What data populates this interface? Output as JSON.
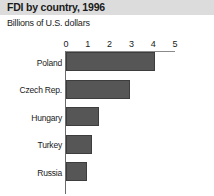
{
  "chart_data": {
    "type": "bar",
    "orientation": "horizontal",
    "title": "FDI by country, 1996",
    "subtitle": "Billions of U.S. dollars",
    "xlabel": "",
    "ylabel": "",
    "xlim": [
      0,
      5
    ],
    "xticks": [
      "0",
      "1",
      "2",
      "3",
      "4",
      "5"
    ],
    "grid": false,
    "legend": null,
    "categories": [
      "Poland",
      "Czech Rep.",
      "Hungary",
      "Turkey",
      "Russia"
    ],
    "values": [
      4.1,
      2.95,
      1.5,
      1.2,
      0.95
    ],
    "bars": [
      {
        "label": "Poland",
        "value": 4.1
      },
      {
        "label": "Czech Rep.",
        "value": 2.95
      },
      {
        "label": "Hungary",
        "value": 1.5
      },
      {
        "label": "Turkey",
        "value": 1.2
      },
      {
        "label": "Russia",
        "value": 0.95
      }
    ],
    "colors": {
      "bar_fill": "#565656",
      "bar_edge": "#3d3d3d",
      "title_band": "#dcdcdc",
      "axis": "#6b6b6b",
      "background": "#ffffff",
      "text": "#1a1a1a"
    }
  }
}
